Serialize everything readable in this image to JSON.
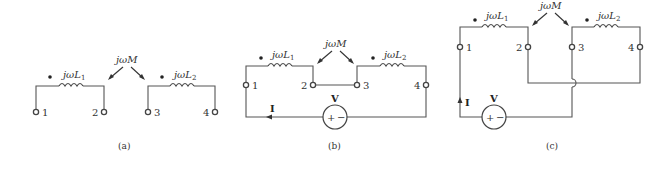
{
  "figure": {
    "panels": [
      {
        "id": "a",
        "caption": "(a)",
        "inductor_1": "jωL",
        "inductor_1_sub": "1",
        "inductor_2": "jωL",
        "inductor_2_sub": "2",
        "mutual": "jωM",
        "terminals": [
          "1",
          "2",
          "3",
          "4"
        ]
      },
      {
        "id": "b",
        "caption": "(b)",
        "inductor_1": "jωL",
        "inductor_1_sub": "1",
        "inductor_2": "jωL",
        "inductor_2_sub": "2",
        "mutual": "jωM",
        "terminals": [
          "1",
          "2",
          "3",
          "4"
        ],
        "source_label": "V",
        "source_plus": "+",
        "source_minus": "−",
        "current_label": "I"
      },
      {
        "id": "c",
        "caption": "(c)",
        "inductor_1": "jωL",
        "inductor_1_sub": "1",
        "inductor_2": "jωL",
        "inductor_2_sub": "2",
        "mutual": "jωM",
        "terminals": [
          "1",
          "2",
          "3",
          "4"
        ],
        "source_label": "V",
        "source_plus": "+",
        "source_minus": "−",
        "current_label": "I"
      }
    ]
  }
}
